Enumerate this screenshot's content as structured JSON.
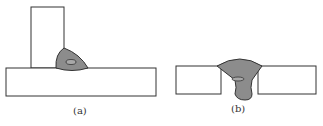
{
  "figures": [
    {
      "id": "a",
      "label": "(a)",
      "description": "T-joint fillet weld"
    },
    {
      "id": "b",
      "label": "(b)",
      "description": "Butt weld with full penetration"
    }
  ],
  "colors": {
    "outline": "#333333",
    "weld_fill": "#8c8c8c",
    "background": "#ffffff"
  }
}
